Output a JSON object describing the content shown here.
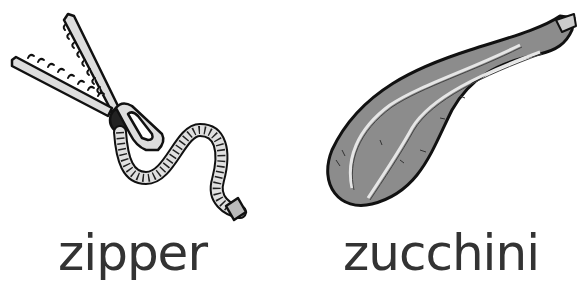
{
  "items": [
    {
      "label": "zipper",
      "icon": "zipper-icon"
    },
    {
      "label": "zucchini",
      "icon": "zucchini-icon"
    }
  ],
  "colors": {
    "text": "#333333",
    "outline": "#111111",
    "zipper_fill": "#d9d9d9",
    "zucchini_fill": "#8c8c8c",
    "stripe": "#e6e6e6"
  }
}
